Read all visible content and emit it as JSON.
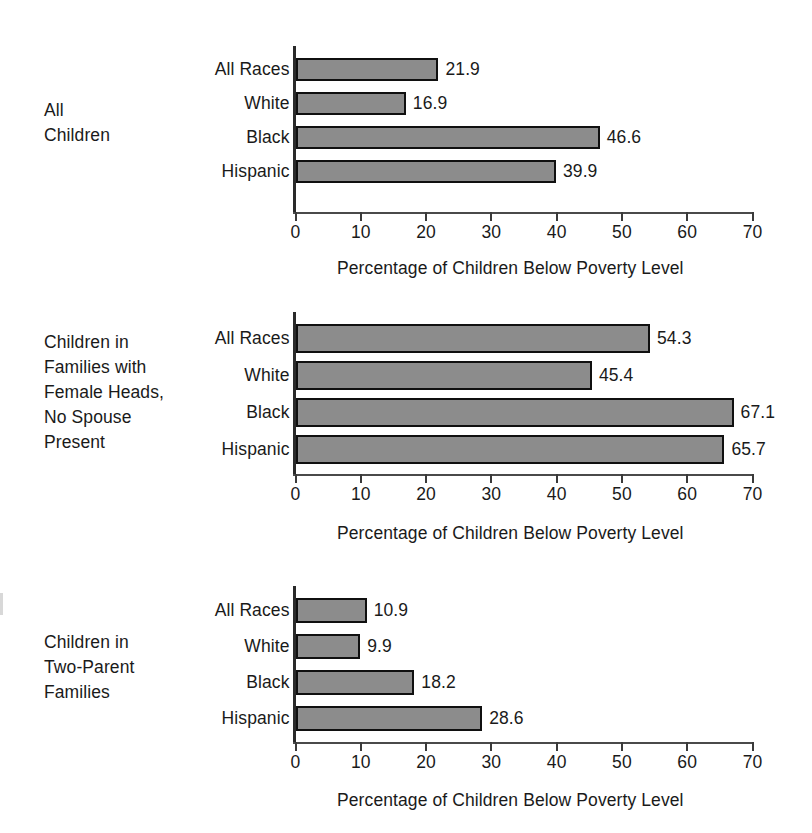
{
  "figure": {
    "axis_title": "Percentage of Children Below Poverty Level",
    "categories": [
      "All Races",
      "White",
      "Black",
      "Hispanic"
    ],
    "ticks": [
      "0",
      "10",
      "20",
      "30",
      "40",
      "50",
      "60",
      "70"
    ],
    "bar_color": "#8c8c8c",
    "bar_border_color": "#101010"
  },
  "chart_data": [
    {
      "type": "bar",
      "orientation": "horizontal",
      "title": "All Children",
      "group_caption": "All\nChildren",
      "categories": [
        "All Races",
        "White",
        "Black",
        "Hispanic"
      ],
      "values": [
        21.9,
        16.9,
        46.6,
        39.9
      ],
      "value_labels": [
        "21.9",
        "16.9",
        "46.6",
        "39.9"
      ],
      "xlabel": "Percentage of Children Below Poverty Level",
      "ylabel": "",
      "xlim": [
        0,
        70
      ],
      "xticks": [
        0,
        10,
        20,
        30,
        40,
        50,
        60,
        70
      ],
      "grid": false,
      "legend": "none"
    },
    {
      "type": "bar",
      "orientation": "horizontal",
      "title": "Children in Families with Female Heads, No Spouse Present",
      "group_caption": "Children in\nFamilies with\nFemale Heads,\nNo Spouse\nPresent",
      "categories": [
        "All Races",
        "White",
        "Black",
        "Hispanic"
      ],
      "values": [
        54.3,
        45.4,
        67.1,
        65.7
      ],
      "value_labels": [
        "54.3",
        "45.4",
        "67.1",
        "65.7"
      ],
      "xlabel": "Percentage of Children Below Poverty Level",
      "ylabel": "",
      "xlim": [
        0,
        70
      ],
      "xticks": [
        0,
        10,
        20,
        30,
        40,
        50,
        60,
        70
      ],
      "grid": false,
      "legend": "none"
    },
    {
      "type": "bar",
      "orientation": "horizontal",
      "title": "Children in Two-Parent Families",
      "group_caption": "Children in\nTwo-Parent\nFamilies",
      "categories": [
        "All Races",
        "White",
        "Black",
        "Hispanic"
      ],
      "values": [
        10.9,
        9.9,
        18.2,
        28.6
      ],
      "value_labels": [
        "10.9",
        "9.9",
        "18.2",
        "28.6"
      ],
      "xlabel": "Percentage of Children Below Poverty Level",
      "ylabel": "",
      "xlim": [
        0,
        70
      ],
      "xticks": [
        0,
        10,
        20,
        30,
        40,
        50,
        60,
        70
      ],
      "grid": false,
      "legend": "none"
    }
  ],
  "panels": [
    {
      "caption_top": 98,
      "plot_top": 46,
      "bar_top": 58,
      "bar_height": 23,
      "bar_gap": 11,
      "axis_y": 212,
      "tick_label_y": 224,
      "axis_title_x": 337,
      "axis_title_y": 260
    },
    {
      "caption_top": 330,
      "plot_top": 312,
      "bar_top": 324,
      "bar_height": 29,
      "bar_gap": 8,
      "axis_y": 474,
      "tick_label_y": 486,
      "axis_title_x": 337,
      "axis_title_y": 525
    },
    {
      "caption_top": 630,
      "plot_top": 586,
      "bar_top": 598,
      "bar_height": 25,
      "bar_gap": 11,
      "axis_y": 742,
      "tick_label_y": 754,
      "axis_title_x": 337,
      "axis_title_y": 792
    }
  ]
}
